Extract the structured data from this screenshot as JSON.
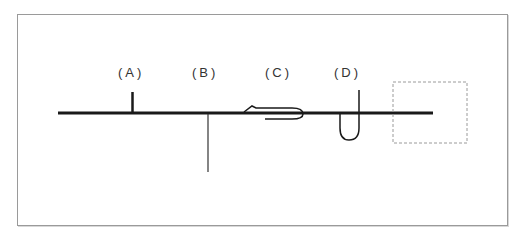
{
  "figure": {
    "labels": [
      {
        "id": "A",
        "text": "(A)",
        "x": 118,
        "y": 65
      },
      {
        "id": "B",
        "text": "(B)",
        "x": 192,
        "y": 65
      },
      {
        "id": "C",
        "text": "(C)",
        "x": 265,
        "y": 65
      },
      {
        "id": "D",
        "text": "(D)",
        "x": 334,
        "y": 65
      }
    ],
    "colors": {
      "line": "#1a1a1a",
      "frame": "#9a9a9a",
      "dashed_box": "#9a9a9a",
      "text": "#333333"
    }
  }
}
